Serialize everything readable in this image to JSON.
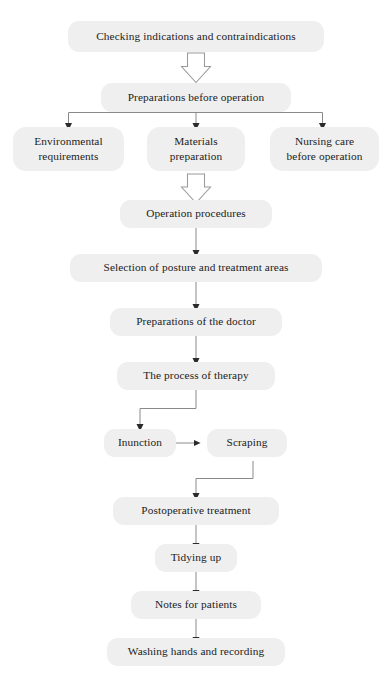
{
  "diagram": {
    "background_color": "#ffffff",
    "node_fill_color": "#efefef",
    "text_color": "#1c1c1c",
    "connector_color": "#8a8a8a",
    "arrowhead_color": "#2b2b2b",
    "hollow_arrow_fill": "#ffffff",
    "hollow_arrow_stroke": "#9a9a9a"
  },
  "nodes": {
    "checking": {
      "label": "Checking indications and contraindications"
    },
    "preparations_before": {
      "label": "Preparations before operation"
    },
    "environmental": {
      "line1": "Environmental",
      "line2": "requirements"
    },
    "materials": {
      "line1": "Materials",
      "line2": "preparation"
    },
    "nursing_care": {
      "line1": "Nursing care",
      "line2": "before operation"
    },
    "operation_procedures": {
      "label": "Operation procedures"
    },
    "selection_posture": {
      "label": "Selection of posture and treatment areas"
    },
    "preparations_doctor": {
      "label": "Preparations of the doctor"
    },
    "process_therapy": {
      "label": "The process of therapy"
    },
    "inunction": {
      "label": "Inunction"
    },
    "scraping": {
      "label": "Scraping"
    },
    "postoperative": {
      "label": "Postoperative treatment"
    },
    "tidying_up": {
      "label": "Tidying up"
    },
    "notes_patients": {
      "label": "Notes for patients"
    },
    "washing_hands": {
      "label": "Washing hands and recording"
    }
  },
  "connectors": [
    {
      "name": "checking-to-preparations",
      "style": "hollow-block-arrow",
      "direction": "down"
    },
    {
      "name": "preparations-to-branch-bar",
      "style": "line",
      "direction": "down"
    },
    {
      "name": "branch-to-environmental",
      "style": "line-arrow",
      "direction": "down"
    },
    {
      "name": "branch-to-materials",
      "style": "line-arrow",
      "direction": "down"
    },
    {
      "name": "branch-to-nursing-care",
      "style": "line-arrow",
      "direction": "down"
    },
    {
      "name": "materials-to-operation-procedures",
      "style": "hollow-block-arrow",
      "direction": "down"
    },
    {
      "name": "operation-procedures-to-selection",
      "style": "line-arrow",
      "direction": "down"
    },
    {
      "name": "selection-to-preparations-doctor",
      "style": "line-arrow",
      "direction": "down"
    },
    {
      "name": "preparations-doctor-to-process",
      "style": "line-arrow",
      "direction": "down"
    },
    {
      "name": "process-to-inunction",
      "style": "elbow-line-arrow",
      "direction": "down-left"
    },
    {
      "name": "inunction-to-scraping",
      "style": "line-arrow",
      "direction": "right"
    },
    {
      "name": "scraping-to-postoperative",
      "style": "elbow-line-arrow",
      "direction": "down-left"
    },
    {
      "name": "postoperative-to-tidying-up",
      "style": "line-arrow",
      "direction": "down"
    },
    {
      "name": "tidying-up-to-notes",
      "style": "line-arrow",
      "direction": "down"
    },
    {
      "name": "notes-to-washing-hands",
      "style": "line-arrow",
      "direction": "down"
    }
  ]
}
